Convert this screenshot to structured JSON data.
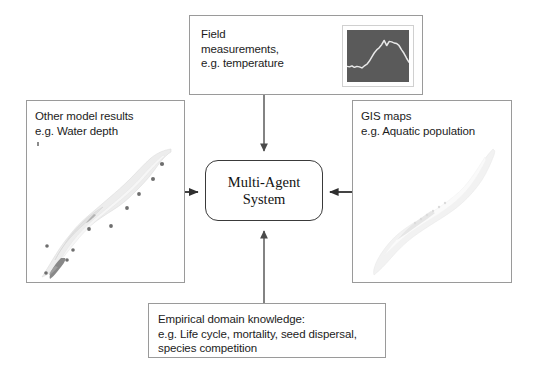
{
  "diagram": {
    "center": {
      "label": "Multi-Agent\nSystem",
      "shape": "rounded-rectangle",
      "border_color": "#3a3a3a"
    },
    "boxes": [
      {
        "id": "field-measurements",
        "label": "Field\nmeasurements,\ne.g. temperature",
        "position": "top",
        "thumbnail": "temperature-line-chart-thumbnail"
      },
      {
        "id": "other-model-results",
        "label": "Other model results\ne.g. Water depth",
        "position": "left",
        "thumbnail": "water-depth-map-thumbnail"
      },
      {
        "id": "gis-maps",
        "label": "GIS maps\ne.g. Aquatic population",
        "position": "right",
        "thumbnail": "aquatic-population-map-thumbnail"
      },
      {
        "id": "empirical-domain-knowledge",
        "label": "Empirical domain knowledge:\ne.g. Life cycle, mortality, seed dispersal,\nspecies competition",
        "position": "bottom",
        "thumbnail": null
      }
    ],
    "arrows": [
      {
        "id": "arrow-top",
        "from": "field-measurements",
        "to": "center",
        "direction": "down"
      },
      {
        "id": "arrow-left",
        "from": "other-model-results",
        "to": "center",
        "direction": "right"
      },
      {
        "id": "arrow-right",
        "from": "gis-maps",
        "to": "center",
        "direction": "left"
      },
      {
        "id": "arrow-bottom",
        "from": "empirical-domain-knowledge",
        "to": "center",
        "direction": "up"
      }
    ],
    "colors": {
      "box_border": "#9a9a9a",
      "center_border": "#3a3a3a",
      "arrow": "#4a4a4a",
      "text": "#1c1c1c",
      "chart_background": "#5a5a5a",
      "chart_line": "#e8e8e8",
      "background": "#ffffff"
    }
  },
  "chart_data": {
    "type": "line",
    "title": "",
    "xlabel": "",
    "ylabel": "",
    "series": [
      {
        "name": "temperature",
        "x": [
          0,
          4,
          8,
          12,
          16,
          20,
          24,
          28,
          32,
          36,
          40,
          44,
          48,
          52,
          56,
          60,
          64,
          68,
          72,
          76,
          80,
          84,
          88,
          92,
          96,
          100
        ],
        "values": [
          30,
          29,
          31,
          28,
          30,
          29,
          27,
          31,
          34,
          40,
          48,
          56,
          62,
          66,
          72,
          80,
          70,
          78,
          77,
          75,
          74,
          70,
          62,
          55,
          46,
          38
        ]
      }
    ],
    "grid": false,
    "legend": "none",
    "xlim": [
      0,
      100
    ],
    "ylim": [
      0,
      100
    ]
  }
}
